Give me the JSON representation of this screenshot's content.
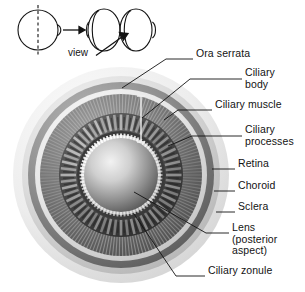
{
  "figure": {
    "domain": "anatomical-illustration",
    "background_color": "#ffffff",
    "ink_color": "#131313"
  },
  "inset": {
    "name": "orientation-diagram",
    "view_label": "view",
    "whole_eye": {
      "cx": 38,
      "cy": 30,
      "r": 20,
      "midline": "dashed-vertical",
      "cornea": "right-bulge"
    },
    "arrow": {
      "from_x": 63,
      "to_x": 82,
      "y": 30
    },
    "halves": [
      {
        "cx": 104,
        "cy": 30,
        "rx": 16,
        "ry": 21
      },
      {
        "cx": 136,
        "cy": 30,
        "rx": 16,
        "ry": 21
      }
    ],
    "pointer": {
      "tip_x": 126,
      "tip_y": 34,
      "tail_x": 98,
      "tail_y": 55
    }
  },
  "eye": {
    "center_x": 121,
    "center_y": 175,
    "rings": [
      {
        "name": "sclera-outer",
        "r": 108,
        "fill": "#e3e3e3"
      },
      {
        "name": "sclera-inner",
        "r": 99,
        "fill": "#cfcfcf"
      },
      {
        "name": "choroid",
        "r": 93,
        "fill": "#8f8f8f"
      },
      {
        "name": "retina",
        "r": 86,
        "fill": "#e9e9e9"
      },
      {
        "name": "ciliary-muscle",
        "r": 81,
        "fill": "#6f6f6f"
      },
      {
        "name": "ciliary-processes",
        "r": 62,
        "fill": "#4a4a4a"
      },
      {
        "name": "ora-serrata",
        "r": 44,
        "fill": "#3a3a3a"
      },
      {
        "name": "ciliary-zonule",
        "r": 40,
        "fill": "#d8d8d8"
      },
      {
        "name": "lens",
        "r": 37,
        "fill": "#9a9a9a"
      }
    ],
    "radial_spokes": {
      "ciliary_processes_count": 56,
      "zonule_fiber_count": 72
    },
    "bracket": {
      "name": "ciliary-body-extent",
      "x": 141,
      "y_top": 96,
      "y_bottom": 142
    }
  },
  "labels": [
    {
      "id": "ora-serrata",
      "text": "Ora serrata",
      "x": 196,
      "y": 54,
      "leader": [
        [
          193,
          59
        ],
        [
          166,
          59
        ],
        [
          122,
          88
        ]
      ]
    },
    {
      "id": "ciliary-body",
      "text": "Ciliary\nbody",
      "x": 245,
      "y": 73,
      "leader": [
        [
          242,
          79
        ],
        [
          190,
          79
        ],
        [
          142,
          118
        ]
      ]
    },
    {
      "id": "ciliary-muscle",
      "text": "Ciliary muscle",
      "x": 215,
      "y": 105,
      "leader": [
        [
          212,
          110
        ],
        [
          178,
          110
        ],
        [
          164,
          120
        ]
      ]
    },
    {
      "id": "ciliary-processes",
      "text": "Ciliary\nprocesses",
      "x": 245,
      "y": 130,
      "leader": [
        [
          242,
          136
        ],
        [
          192,
          136
        ],
        [
          168,
          146
        ]
      ]
    },
    {
      "id": "retina",
      "text": "Retina",
      "x": 238,
      "y": 164,
      "leader": [
        [
          235,
          169
        ],
        [
          212,
          169
        ]
      ]
    },
    {
      "id": "choroid",
      "text": "Choroid",
      "x": 238,
      "y": 186,
      "leader": [
        [
          235,
          191
        ],
        [
          214,
          191
        ]
      ]
    },
    {
      "id": "sclera",
      "text": "Sclera",
      "x": 238,
      "y": 207,
      "leader": [
        [
          235,
          212
        ],
        [
          216,
          212
        ]
      ]
    },
    {
      "id": "lens",
      "text": "Lens\n(posterior\naspect)",
      "x": 232,
      "y": 228,
      "leader": [
        [
          229,
          233
        ],
        [
          206,
          233
        ],
        [
          134,
          192
        ]
      ]
    },
    {
      "id": "ciliary-zonule",
      "text": "Ciliary zonule",
      "x": 208,
      "y": 271,
      "leader": [
        [
          205,
          276
        ],
        [
          176,
          276
        ],
        [
          134,
          214
        ]
      ]
    }
  ]
}
